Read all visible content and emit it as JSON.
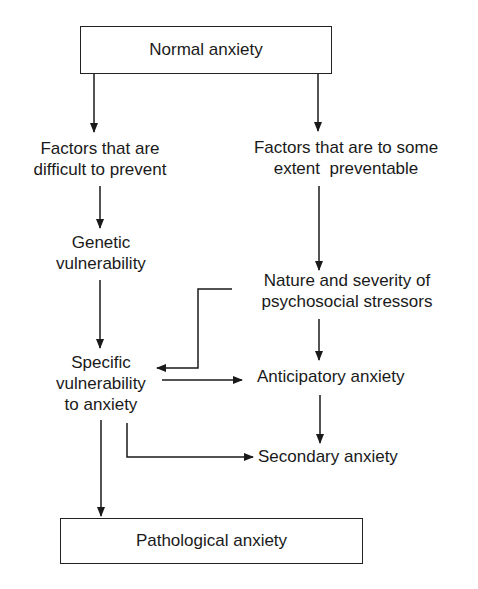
{
  "diagram": {
    "type": "flowchart",
    "nodes": {
      "normal": {
        "label": "Normal anxiety"
      },
      "difficult": {
        "lines": [
          "Factors that are",
          "difficult to prevent"
        ]
      },
      "preventable": {
        "lines": [
          "Factors that are to some",
          "extent  preventable"
        ]
      },
      "genetic": {
        "lines": [
          "Genetic",
          "vulnerability"
        ]
      },
      "stressors": {
        "lines": [
          "Nature and severity of",
          "psychosocial stressors"
        ]
      },
      "specific": {
        "lines": [
          "Specific",
          "vulnerability",
          "to anxiety"
        ]
      },
      "anticipatory": {
        "label": "Anticipatory anxiety"
      },
      "secondary": {
        "label": "Secondary anxiety"
      },
      "pathological": {
        "label": "Pathological anxiety"
      }
    },
    "edges": [
      {
        "from": "Normal anxiety",
        "to": "Factors that are difficult to prevent"
      },
      {
        "from": "Normal anxiety",
        "to": "Factors that are to some extent preventable"
      },
      {
        "from": "Factors that are difficult to prevent",
        "to": "Genetic vulnerability"
      },
      {
        "from": "Factors that are to some extent preventable",
        "to": "Nature and severity of psychosocial stressors"
      },
      {
        "from": "Genetic vulnerability",
        "to": "Specific vulnerability to anxiety"
      },
      {
        "from": "Nature and severity of psychosocial stressors",
        "to": "Specific vulnerability to anxiety"
      },
      {
        "from": "Nature and severity of psychosocial stressors",
        "to": "Anticipatory anxiety"
      },
      {
        "from": "Specific vulnerability to anxiety",
        "to": "Anticipatory anxiety"
      },
      {
        "from": "Anticipatory anxiety",
        "to": "Secondary anxiety"
      },
      {
        "from": "Specific vulnerability to anxiety",
        "to": "Secondary anxiety"
      },
      {
        "from": "Specific vulnerability to anxiety",
        "to": "Pathological anxiety"
      }
    ],
    "colors": {
      "line": "#1a1a1a",
      "background": "#ffffff"
    }
  }
}
